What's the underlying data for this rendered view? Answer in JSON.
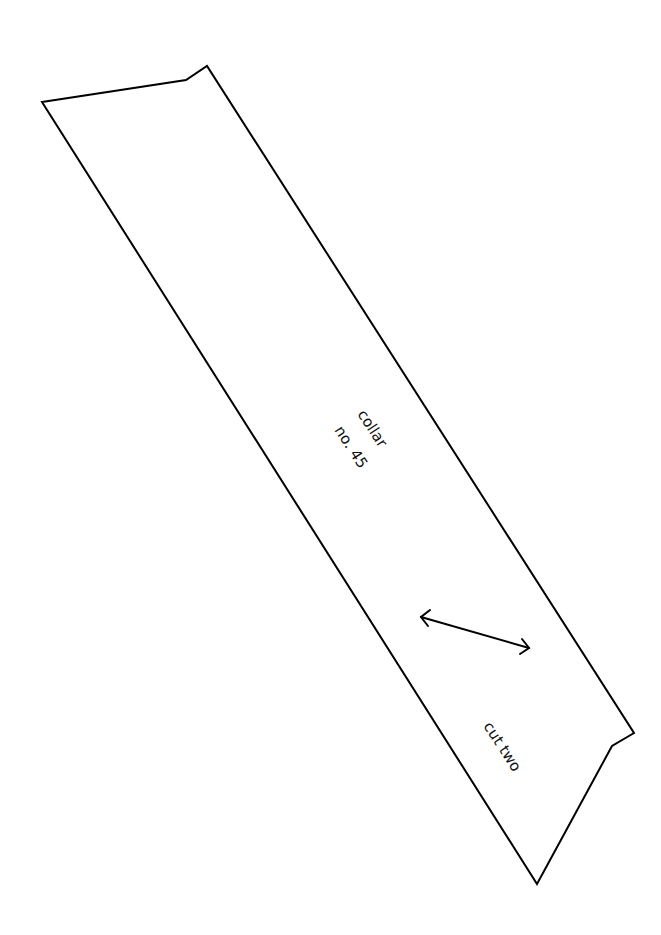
{
  "pattern_piece": {
    "name": "collar",
    "number": "no. 45",
    "instruction": "cut two",
    "grainline": "double-arrow-grainline",
    "outline_color": "#000000",
    "background_color": "#ffffff"
  }
}
